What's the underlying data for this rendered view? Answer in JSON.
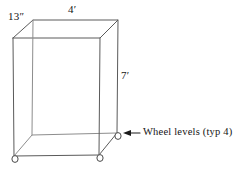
{
  "diagram": {
    "shape": "rectangular-box",
    "labels": {
      "depth": "13″",
      "width": "4′",
      "height": "7′",
      "callout": "Wheel levels (typ 4)"
    },
    "dimensions": {
      "depth_value": "13",
      "depth_unit": "inches",
      "width_value": "4",
      "width_unit": "feet",
      "height_value": "7",
      "height_unit": "feet"
    },
    "wheel_count": "4",
    "colors": {
      "edge": "#5a5a5a",
      "hidden_edge": "#8d8d8d",
      "leader": "#1a1a1a",
      "text": "#141414",
      "background": "#ffffff"
    }
  }
}
